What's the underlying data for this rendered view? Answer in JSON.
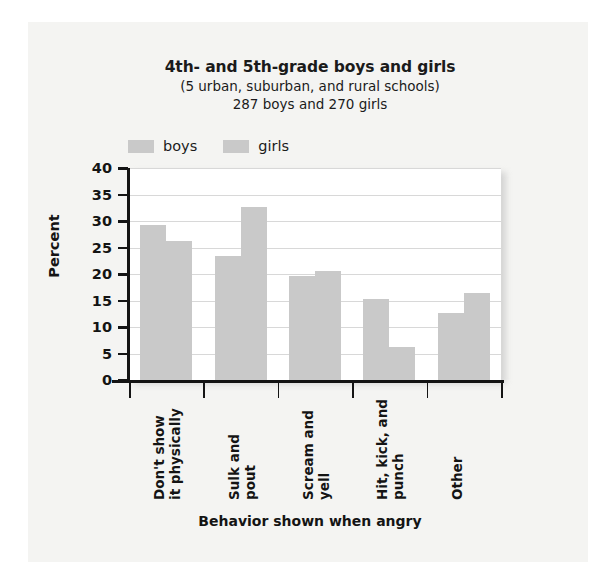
{
  "chart_data": {
    "type": "bar",
    "title": "4th- and 5th-grade boys and girls",
    "subtitle": "(5 urban, suburban, and rural schools)",
    "subtitle2": "287 boys and 270 girls",
    "xlabel": "Behavior shown when angry",
    "ylabel": "Percent",
    "ylim": [
      0,
      40
    ],
    "yticks": [
      0,
      5,
      10,
      15,
      20,
      25,
      30,
      35,
      40
    ],
    "grid": true,
    "legend_position": "top-left",
    "categories": [
      "Don't show it physically",
      "Sulk and pout",
      "Scream and yell",
      "Hit, kick, and punch",
      "Other"
    ],
    "category_lines": [
      [
        "Don't show",
        "it physically"
      ],
      [
        "Sulk and",
        "pout"
      ],
      [
        "Scream and",
        "yell"
      ],
      [
        "Hit, kick, and",
        "punch"
      ],
      [
        "Other",
        ""
      ]
    ],
    "series": [
      {
        "name": "boys",
        "color": "#c9c9c9",
        "values": [
          29.2,
          23.4,
          19.7,
          15.3,
          12.7
        ]
      },
      {
        "name": "girls",
        "color": "#c9c9c9",
        "values": [
          26.2,
          32.7,
          20.6,
          6.3,
          16.5
        ]
      }
    ]
  },
  "legend": {
    "items": [
      {
        "label": "boys",
        "color": "#c9c9c9"
      },
      {
        "label": "girls",
        "color": "#c9c9c9"
      }
    ]
  },
  "colors": {
    "bar": "#c9c9c9",
    "axis": "#141414",
    "grid": "#d8d8d8",
    "plot_background": "#ffffff",
    "page_background": "#f4f4f2"
  }
}
